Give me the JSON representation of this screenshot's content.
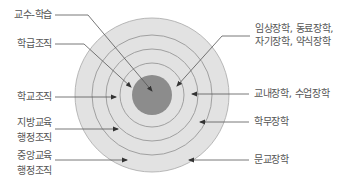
{
  "diagram": {
    "type": "concentric-circles",
    "colors": {
      "core": "#8c8c8c",
      "ring_fill": "#e2e2e2",
      "ring_line": "#a0a0a0",
      "pointer": "#444444",
      "text": "#555555"
    },
    "left_labels": [
      {
        "lines": [
          "교수-학습"
        ]
      },
      {
        "lines": [
          "학급조직"
        ]
      },
      {
        "lines": [
          "학교조직"
        ]
      },
      {
        "lines": [
          "지방교육",
          "행정조직"
        ]
      },
      {
        "lines": [
          "중앙교육",
          "행정조직"
        ]
      }
    ],
    "right_labels": [
      {
        "lines": [
          "임상장학, 동료장학,",
          "자기장학, 약식장학"
        ]
      },
      {
        "lines": [
          "교내장학, 수업장학"
        ]
      },
      {
        "lines": [
          "학무장학"
        ]
      },
      {
        "lines": [
          "문교장학"
        ]
      }
    ]
  }
}
